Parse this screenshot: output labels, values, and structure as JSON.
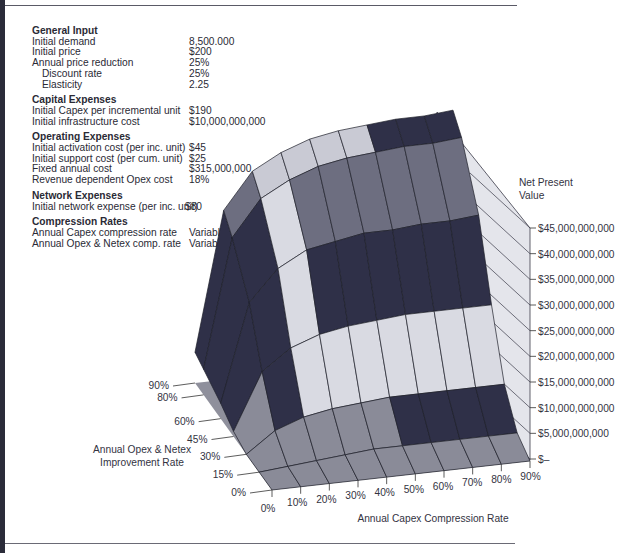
{
  "inputs": {
    "sections": [
      {
        "title": "General Input",
        "rows": [
          {
            "label": "Initial demand",
            "value": "8,500.000",
            "indent": false
          },
          {
            "label": "Initial price",
            "value": "$200",
            "indent": false
          },
          {
            "label": "Annual price reduction",
            "value": "25%",
            "indent": false
          },
          {
            "label": "Discount rate",
            "value": "25%",
            "indent": true
          },
          {
            "label": "Elasticity",
            "value": "2.25",
            "indent": true
          }
        ]
      },
      {
        "title": "Capital Expenses",
        "rows": [
          {
            "label": "Initial Capex per incremental unit",
            "value": "$190",
            "indent": false
          },
          {
            "label": "Initial infrastructure cost",
            "value": "$10,000,000,000",
            "indent": false
          }
        ]
      },
      {
        "title": "Operating Expenses",
        "rows": [
          {
            "label": "Initial activation cost (per inc. unit)",
            "value": "$45",
            "indent": false
          },
          {
            "label": "Initial support cost (per cum. unit)",
            "value": "$25",
            "indent": false
          },
          {
            "label": "Fixed annual cost",
            "value": "$315,000,000",
            "indent": false
          },
          {
            "label": "Revenue dependent Opex cost",
            "value": "18%",
            "indent": false
          }
        ]
      },
      {
        "title": "Network Expenses",
        "rows": [
          {
            "label": "Initial network expense (per inc. unit)",
            "value": "$80",
            "indent": false
          }
        ]
      },
      {
        "title": "Compression Rates",
        "rows": [
          {
            "label": "Annual Capex compression rate",
            "value": "Variable",
            "indent": false
          },
          {
            "label": "Annual Opex & Netex comp. rate",
            "value": "Variable",
            "indent": false
          }
        ]
      }
    ]
  },
  "chart_data": {
    "type": "surface",
    "title": "",
    "xlabel": "Annual Capex Compression Rate",
    "ylabel": "Annual Opex & Netex Improvement Rate",
    "zlabel": "Net Present Value",
    "x_ticks": [
      "0%",
      "10%",
      "20%",
      "30%",
      "40%",
      "50%",
      "60%",
      "70%",
      "80%",
      "90%"
    ],
    "y_ticks": [
      "0%",
      "15%",
      "30%",
      "45%",
      "60%",
      "80%",
      "90%"
    ],
    "z_ticks": [
      "$–",
      "$5,000,000,000",
      "$10,000,000,000",
      "$15,000,000,000",
      "$20,000,000,000",
      "$25,000,000,000",
      "$30,000,000,000",
      "$35,000,000,000",
      "$40,000,000,000",
      "$45,000,000,000"
    ],
    "zlim": [
      0,
      45000000000
    ],
    "x": [
      0,
      10,
      20,
      30,
      40,
      50,
      60,
      70,
      80,
      90
    ],
    "y": [
      0,
      15,
      30,
      45,
      60,
      80,
      90
    ],
    "z_billions": [
      [
        0,
        0,
        0,
        0,
        0,
        0,
        0,
        0,
        0,
        0
      ],
      [
        0,
        0.5,
        1,
        1.5,
        2,
        2,
        2,
        2,
        2,
        2
      ],
      [
        0,
        4,
        6,
        7,
        7.5,
        8,
        8,
        8,
        8,
        8
      ],
      [
        1,
        12,
        16,
        18,
        19,
        19.5,
        20,
        20,
        20,
        20
      ],
      [
        3,
        22,
        28,
        31,
        32,
        33,
        33,
        33.5,
        33.5,
        34
      ],
      [
        5,
        30,
        37,
        40,
        42,
        43,
        43.5,
        44,
        44,
        44.5
      ],
      [
        6,
        33,
        40,
        43,
        45,
        46,
        46.5,
        47,
        47,
        47.5
      ]
    ],
    "band_colors": [
      "#8a8b98",
      "#2f3048",
      "#d9dae2",
      "#2f3048",
      "#d9dae2",
      "#2f3048",
      "#d9dae2",
      "#6d6e80",
      "#c9cad4",
      "#2f3048"
    ]
  }
}
